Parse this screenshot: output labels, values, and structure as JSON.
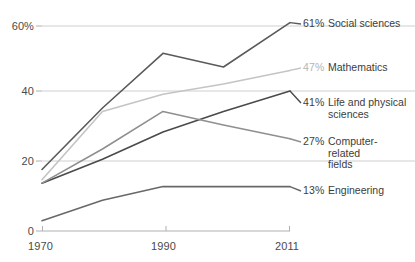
{
  "chart_data": {
    "type": "line",
    "title": "",
    "xlabel": "",
    "ylabel": "",
    "x": [
      1970,
      1980,
      1990,
      2000,
      2011
    ],
    "xlim": [
      1970,
      2011
    ],
    "ylim": [
      0,
      65
    ],
    "yticks": [
      0,
      20,
      40,
      60
    ],
    "ytick_labels": [
      "0",
      "20",
      "40",
      "60%"
    ],
    "xticks": [
      1970,
      1990,
      2011
    ],
    "xtick_labels": [
      "1970",
      "1990",
      "2011"
    ],
    "grid": "horizontal",
    "legend_position": "right-end-labels",
    "series": [
      {
        "name": "Social sciences",
        "end_value_label": "61%",
        "end_value": 61,
        "color": "#5a5a5a",
        "values": [
          18,
          36,
          52,
          48,
          61
        ]
      },
      {
        "name": "Mathematics",
        "end_value_label": "47%",
        "end_value": 47,
        "color": "#c4c4c4",
        "values": [
          15,
          35,
          40,
          43,
          47
        ]
      },
      {
        "name": "Life and physical\nsciences",
        "end_value_label": "41%",
        "end_value": 41,
        "color": "#4a4a4a",
        "values": [
          14,
          21,
          29,
          35,
          41
        ]
      },
      {
        "name": "Computer-\nrelated\nfields",
        "end_value_label": "27%",
        "end_value": 27,
        "color": "#8f8f8f",
        "values": [
          14,
          24,
          35,
          31,
          27
        ]
      },
      {
        "name": "Engineering",
        "end_value_label": "13%",
        "end_value": 13,
        "color": "#686868",
        "values": [
          3,
          9,
          13,
          13,
          13
        ]
      }
    ]
  },
  "axis": {
    "y_labels": [
      "60%",
      "40",
      "20",
      "0"
    ],
    "x_labels": [
      "1970",
      "1990",
      "2011"
    ]
  },
  "colors": {
    "gridline": "#cfcfcf",
    "axis": "#b0b0b0",
    "text": "#3c3c3c",
    "background": "#ffffff"
  }
}
